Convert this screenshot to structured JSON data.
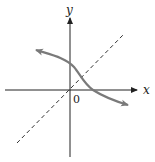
{
  "diagram": {
    "axes": {
      "x_label": "x",
      "y_label": "y",
      "origin_label": "0"
    },
    "elements": [
      {
        "name": "curve",
        "kind": "decreasing curve with arrowheads at both ends",
        "color": "#7a7a7a"
      },
      {
        "name": "line-y-equals-x",
        "kind": "dashed line through origin",
        "color": "#333333"
      }
    ],
    "colors": {
      "axis": "#222222",
      "curve": "#7a7a7a",
      "dashed": "#333333"
    }
  }
}
